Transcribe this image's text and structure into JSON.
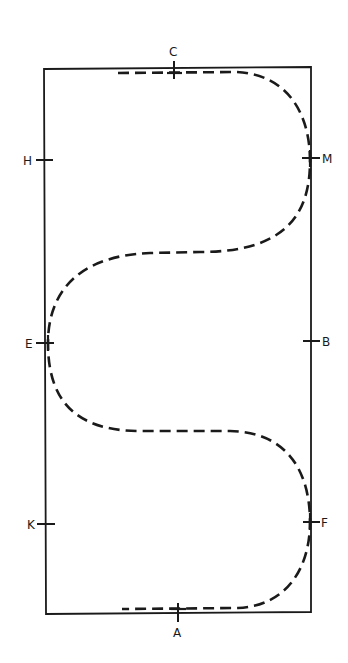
{
  "diagram": {
    "type": "dressage-arena",
    "line_color": "#1a1a1a",
    "background": "#ffffff",
    "markers": {
      "C": {
        "label": "C",
        "side": "top"
      },
      "H": {
        "label": "H",
        "side": "left"
      },
      "M": {
        "label": "M",
        "side": "right"
      },
      "E": {
        "label": "E",
        "side": "left"
      },
      "B": {
        "label": "B",
        "side": "right"
      },
      "K": {
        "label": "K",
        "side": "left"
      },
      "F": {
        "label": "F",
        "side": "right"
      },
      "A": {
        "label": "A",
        "side": "bottom"
      }
    },
    "route": {
      "style": "dashed",
      "sequence": [
        "C",
        "M",
        "E",
        "F",
        "A"
      ],
      "loops": 3
    }
  }
}
